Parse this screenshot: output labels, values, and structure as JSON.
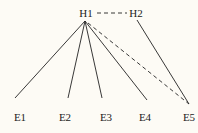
{
  "diagram": {
    "background": "#fdfbf5",
    "line_color": "#222222",
    "nodes": {
      "H1": {
        "label": "H1",
        "x": 86,
        "y": 17
      },
      "H2": {
        "label": "H2",
        "x": 136,
        "y": 17
      },
      "E1": {
        "label": "E1",
        "x": 20,
        "y": 121
      },
      "E2": {
        "label": "E2",
        "x": 65,
        "y": 121
      },
      "E3": {
        "label": "E3",
        "x": 106,
        "y": 121
      },
      "E4": {
        "label": "E4",
        "x": 145,
        "y": 121
      },
      "E5": {
        "label": "E5",
        "x": 189,
        "y": 121
      }
    },
    "edges": [
      {
        "from": "H1",
        "to": "E1",
        "style": "solid"
      },
      {
        "from": "H1",
        "to": "E2",
        "style": "solid"
      },
      {
        "from": "H1",
        "to": "E3",
        "style": "solid"
      },
      {
        "from": "H1",
        "to": "E4",
        "style": "solid"
      },
      {
        "from": "H1",
        "to": "E5",
        "style": "dashed"
      },
      {
        "from": "H2",
        "to": "E5",
        "style": "solid"
      },
      {
        "from": "H1",
        "to": "H2",
        "style": "dashed"
      }
    ]
  }
}
